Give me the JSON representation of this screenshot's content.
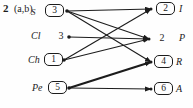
{
  "figure": {
    "question_number": "2",
    "question_label": "(a,b)",
    "left_nodes": [
      {
        "label": "S",
        "value": "3",
        "boxed": true
      },
      {
        "label": "Cl",
        "value": "3",
        "boxed": false
      },
      {
        "label": "Ch",
        "value": "1",
        "boxed": true
      },
      {
        "label": "Pe",
        "value": "5",
        "boxed": true
      }
    ],
    "right_nodes": [
      {
        "value": "2",
        "label": "I",
        "boxed": true
      },
      {
        "value": "2",
        "label": "P",
        "boxed": false
      },
      {
        "value": "4",
        "label": "R",
        "boxed": true
      },
      {
        "value": "6",
        "label": "A",
        "boxed": true
      }
    ],
    "edges": [
      {
        "from": "S",
        "to": "I"
      },
      {
        "from": "S",
        "to": "P"
      },
      {
        "from": "S",
        "to": "R"
      },
      {
        "from": "Cl",
        "to": "P"
      },
      {
        "from": "Ch",
        "to": "I"
      },
      {
        "from": "Ch",
        "to": "P"
      },
      {
        "from": "Pe",
        "to": "R",
        "thick": true
      },
      {
        "from": "Pe",
        "to": "A"
      }
    ],
    "colors": {
      "ink": "#1c1c1c",
      "background": "#fefefe"
    }
  }
}
